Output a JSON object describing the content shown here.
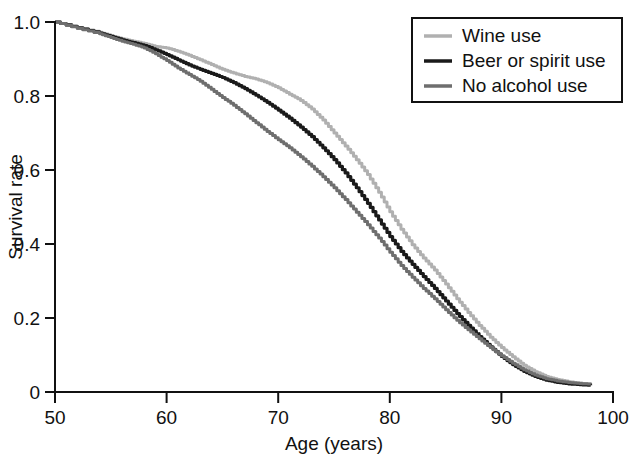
{
  "chart_data": {
    "type": "line",
    "title": "",
    "subtitle": "",
    "xlabel": "Age (years)",
    "ylabel": "Survival rate",
    "xlim": [
      50,
      100
    ],
    "ylim": [
      0,
      1.0
    ],
    "xticks": [
      50,
      60,
      70,
      80,
      90,
      100
    ],
    "xtick_labels": [
      "50",
      "60",
      "70",
      "80",
      "90",
      "100"
    ],
    "yticks": [
      0,
      0.2,
      0.4,
      0.6,
      0.8,
      1.0
    ],
    "ytick_labels": [
      "0",
      "0.2",
      "0.4",
      "0.6",
      "0.8",
      "1.0"
    ],
    "grid": false,
    "legend_position": "top-right",
    "x": [
      50,
      52,
      54,
      55,
      56,
      57,
      58,
      59,
      60,
      61,
      62,
      63,
      64,
      65,
      66,
      67,
      68,
      69,
      70,
      71,
      72,
      73,
      74,
      75,
      76,
      77,
      78,
      79,
      80,
      81,
      82,
      83,
      84,
      85,
      86,
      87,
      88,
      89,
      90,
      91,
      92,
      93,
      94,
      95,
      96,
      97,
      98
    ],
    "series": [
      {
        "name": "Wine use",
        "color": "#b0b0b0",
        "values": [
          1.0,
          0.985,
          0.972,
          0.963,
          0.955,
          0.948,
          0.942,
          0.934,
          0.93,
          0.921,
          0.91,
          0.898,
          0.885,
          0.872,
          0.862,
          0.853,
          0.846,
          0.836,
          0.822,
          0.805,
          0.788,
          0.765,
          0.735,
          0.7,
          0.665,
          0.628,
          0.588,
          0.54,
          0.487,
          0.44,
          0.398,
          0.362,
          0.33,
          0.292,
          0.252,
          0.215,
          0.18,
          0.148,
          0.12,
          0.095,
          0.072,
          0.055,
          0.042,
          0.034,
          0.028,
          0.024,
          0.021
        ]
      },
      {
        "name": "Beer or spirit use",
        "color": "#1a1a1a",
        "values": [
          1.0,
          0.984,
          0.97,
          0.961,
          0.952,
          0.944,
          0.936,
          0.925,
          0.912,
          0.898,
          0.884,
          0.872,
          0.861,
          0.85,
          0.836,
          0.82,
          0.802,
          0.783,
          0.762,
          0.74,
          0.716,
          0.69,
          0.66,
          0.628,
          0.592,
          0.552,
          0.51,
          0.465,
          0.42,
          0.38,
          0.345,
          0.312,
          0.28,
          0.246,
          0.212,
          0.18,
          0.15,
          0.122,
          0.096,
          0.074,
          0.056,
          0.042,
          0.032,
          0.026,
          0.022,
          0.02,
          0.018
        ]
      },
      {
        "name": "No alcohol use",
        "color": "#6e6e6e",
        "values": [
          1.0,
          0.983,
          0.968,
          0.958,
          0.948,
          0.94,
          0.93,
          0.914,
          0.896,
          0.876,
          0.858,
          0.84,
          0.818,
          0.796,
          0.775,
          0.752,
          0.728,
          0.704,
          0.682,
          0.66,
          0.636,
          0.61,
          0.582,
          0.552,
          0.52,
          0.486,
          0.452,
          0.416,
          0.378,
          0.342,
          0.31,
          0.28,
          0.252,
          0.222,
          0.194,
          0.168,
          0.144,
          0.12,
          0.098,
          0.078,
          0.06,
          0.046,
          0.036,
          0.03,
          0.026,
          0.023,
          0.021
        ]
      }
    ]
  },
  "axes": {
    "xlabel": "Age (years)",
    "ylabel": "Survival rate"
  },
  "legend": {
    "items": [
      {
        "label": "Wine use",
        "color": "#b0b0b0"
      },
      {
        "label": "Beer or spirit use",
        "color": "#1a1a1a"
      },
      {
        "label": "No alcohol use",
        "color": "#6e6e6e"
      }
    ]
  }
}
